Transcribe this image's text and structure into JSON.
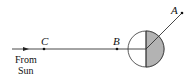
{
  "diagram": {
    "points": [
      {
        "label": "A",
        "x": 182,
        "y": 13,
        "lx": 171,
        "ly": 14
      },
      {
        "label": "B",
        "x": 117,
        "y": 49,
        "lx": 113,
        "ly": 45
      },
      {
        "label": "C",
        "x": 44,
        "y": 49,
        "lx": 41,
        "ly": 45
      }
    ],
    "source_label": [
      "From",
      "Sun"
    ],
    "body": {
      "cx": 146,
      "cy": 49,
      "r": 18,
      "shaded_half": "right",
      "shade_color": "#b3b3b3"
    },
    "ray": {
      "x1": 12,
      "y1": 49,
      "x2": 146,
      "y2": 49,
      "arrow_x": 26
    },
    "line_color": "#333333"
  }
}
